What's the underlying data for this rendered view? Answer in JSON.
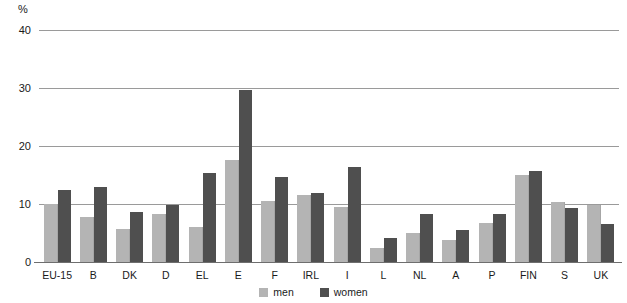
{
  "chart_data": {
    "type": "bar",
    "title": "",
    "xlabel": "",
    "ylabel": "%",
    "ylim": [
      0,
      40
    ],
    "yticks": [
      0,
      10,
      20,
      30,
      40
    ],
    "grid": true,
    "legend_position": "bottom-center",
    "categories": [
      "EU-15",
      "B",
      "DK",
      "D",
      "EL",
      "E",
      "F",
      "IRL",
      "I",
      "L",
      "NL",
      "A",
      "P",
      "FIN",
      "S",
      "UK"
    ],
    "series": [
      {
        "name": "men",
        "color": "#b4b4b4",
        "values": [
          10.0,
          7.7,
          5.7,
          8.3,
          6.1,
          17.6,
          10.6,
          11.6,
          9.5,
          2.5,
          5.0,
          3.8,
          6.7,
          15.0,
          10.4,
          9.9
        ]
      },
      {
        "name": "women",
        "color": "#4f4f4f",
        "values": [
          12.4,
          12.9,
          8.7,
          9.9,
          15.3,
          29.6,
          14.6,
          11.9,
          16.4,
          4.2,
          8.2,
          5.5,
          8.3,
          15.7,
          9.3,
          6.5
        ]
      }
    ]
  },
  "axis": {
    "unit_label": "%",
    "tick_labels": [
      "40",
      "30",
      "20",
      "10",
      "0"
    ]
  },
  "legend": {
    "items": [
      {
        "label": "men"
      },
      {
        "label": "women"
      }
    ]
  }
}
